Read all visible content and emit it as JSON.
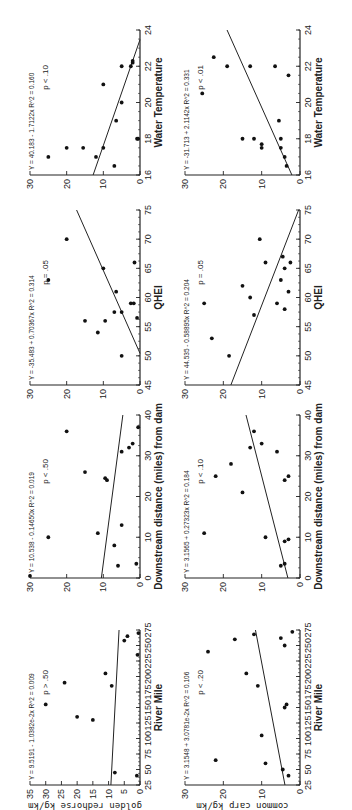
{
  "chart_data": [
    {
      "type": "scatter",
      "row": 0,
      "col": 0,
      "ylabel": "golden redhorse kg/km",
      "xlabel": "River Mile",
      "xlim": [
        25,
        275
      ],
      "ylim": [
        0,
        35
      ],
      "xticks": [
        25,
        50,
        75,
        100,
        125,
        150,
        175,
        200,
        225,
        250,
        275
      ],
      "yticks": [
        0,
        5,
        10,
        15,
        20,
        25,
        30,
        35
      ],
      "equation": "Y = 9.5191 - 1.0382e-2x   R^2 = 0.009",
      "p_value": "p > .50",
      "fit": {
        "intercept": 9.5191,
        "slope": -0.010382
      },
      "points": [
        [
          40,
          1
        ],
        [
          45,
          8
        ],
        [
          130,
          15
        ],
        [
          135,
          20
        ],
        [
          155,
          30
        ],
        [
          185,
          9
        ],
        [
          190,
          24
        ],
        [
          205,
          11
        ],
        [
          235,
          0.8
        ],
        [
          258,
          5
        ],
        [
          265,
          4
        ],
        [
          270,
          0.5
        ]
      ]
    },
    {
      "type": "scatter",
      "row": 0,
      "col": 1,
      "xlabel": "Downstream distance (miles) from dam",
      "xlim": [
        0,
        40
      ],
      "ylim": [
        0,
        30
      ],
      "xticks": [
        0,
        10,
        20,
        30,
        40
      ],
      "yticks": [
        0,
        10,
        20,
        30
      ],
      "equation": "Y = 10.538 - 0.14650x   R^2 = 0.019",
      "p_value": "p < .50",
      "fit": {
        "intercept": 10.538,
        "slope": -0.1465
      },
      "points": [
        [
          0.5,
          30
        ],
        [
          3,
          6
        ],
        [
          3.5,
          1
        ],
        [
          8,
          7
        ],
        [
          10,
          25
        ],
        [
          11,
          11.5
        ],
        [
          13,
          5
        ],
        [
          24,
          9
        ],
        [
          24.5,
          9.5
        ],
        [
          26,
          15
        ],
        [
          31,
          5
        ],
        [
          32,
          3
        ],
        [
          33,
          2
        ],
        [
          36,
          20
        ],
        [
          37,
          0.5
        ]
      ]
    },
    {
      "type": "scatter",
      "row": 0,
      "col": 2,
      "xlabel": "QHEI",
      "xlim": [
        45,
        75
      ],
      "ylim": [
        0,
        30
      ],
      "xticks": [
        45,
        50,
        55,
        60,
        65,
        70,
        75
      ],
      "yticks": [
        0,
        10,
        20,
        30
      ],
      "equation": "Y = -35.483 + 0.70367x   R^2 = 0.314",
      "p_value": "p = .05",
      "fit": {
        "intercept": -35.483,
        "slope": 0.70367
      },
      "points": [
        [
          50,
          5
        ],
        [
          54,
          11.5
        ],
        [
          56,
          15
        ],
        [
          56,
          9.5
        ],
        [
          57.5,
          7
        ],
        [
          57.5,
          5
        ],
        [
          59,
          2.5
        ],
        [
          59,
          1.7
        ],
        [
          56.5,
          0.8
        ],
        [
          61,
          6.5
        ],
        [
          63,
          25
        ],
        [
          65,
          10
        ],
        [
          66,
          1.5
        ],
        [
          70,
          20
        ]
      ]
    },
    {
      "type": "scatter",
      "row": 0,
      "col": 3,
      "xlabel": "Water Temperature",
      "xlim": [
        16,
        24
      ],
      "ylim": [
        0,
        30
      ],
      "xticks": [
        16,
        18,
        20,
        22,
        24
      ],
      "yticks": [
        0,
        10,
        20,
        30
      ],
      "equation": "Y = 40.183 - 1.7122x   R^2 = 0.160",
      "p_value": "p < .10",
      "fit": {
        "intercept": 40.183,
        "slope": -1.7122
      },
      "points": [
        [
          16.5,
          7
        ],
        [
          17,
          25
        ],
        [
          17,
          12
        ],
        [
          17.5,
          20
        ],
        [
          17.5,
          15.5
        ],
        [
          17.5,
          10
        ],
        [
          18,
          0.8
        ],
        [
          18,
          0.5
        ],
        [
          19,
          6.5
        ],
        [
          20,
          5
        ],
        [
          21,
          10
        ],
        [
          22,
          5
        ],
        [
          22,
          2.5
        ],
        [
          22.2,
          2
        ],
        [
          22.3,
          2
        ]
      ]
    },
    {
      "type": "scatter",
      "row": 1,
      "col": 0,
      "ylabel": "common carp kg/km",
      "xlabel": "River Mile",
      "xlim": [
        25,
        275
      ],
      "ylim": [
        0,
        30
      ],
      "xticks": [
        25,
        50,
        75,
        100,
        125,
        150,
        175,
        200,
        225,
        250,
        275
      ],
      "yticks": [
        0,
        10,
        20,
        30
      ],
      "equation": "Y = 3.1548 + 3.0781e-2x   R^2 = 0.106",
      "p_value": "p < .20",
      "fit": {
        "intercept": 3.1548,
        "slope": 0.030781
      },
      "points": [
        [
          40,
          3
        ],
        [
          50,
          4.5
        ],
        [
          60,
          9
        ],
        [
          65,
          22
        ],
        [
          105,
          10
        ],
        [
          150,
          4
        ],
        [
          155,
          3.5
        ],
        [
          185,
          11
        ],
        [
          205,
          14
        ],
        [
          240,
          24
        ],
        [
          250,
          4
        ],
        [
          260,
          17
        ],
        [
          262,
          5
        ],
        [
          268,
          12
        ],
        [
          272,
          2
        ]
      ]
    },
    {
      "type": "scatter",
      "row": 1,
      "col": 1,
      "xlabel": "Downstream distance (miles) from dam",
      "xlim": [
        0,
        40
      ],
      "ylim": [
        0,
        30
      ],
      "xticks": [
        0,
        10,
        20,
        30,
        40
      ],
      "yticks": [
        0,
        10,
        20,
        30
      ],
      "equation": "Y = 3.1565 + 0.27323x   R^2 = 0.184",
      "p_value": "p < .10",
      "fit": {
        "intercept": 3.1565,
        "slope": 0.27323
      },
      "points": [
        [
          3,
          5
        ],
        [
          3.5,
          4
        ],
        [
          9,
          4
        ],
        [
          9.5,
          3
        ],
        [
          10,
          9
        ],
        [
          11,
          25
        ],
        [
          21,
          15
        ],
        [
          24,
          4
        ],
        [
          25,
          3
        ],
        [
          25,
          22
        ],
        [
          28,
          18
        ],
        [
          31,
          6
        ],
        [
          32,
          13
        ],
        [
          33,
          10
        ],
        [
          36,
          12
        ]
      ]
    },
    {
      "type": "scatter",
      "row": 1,
      "col": 2,
      "xlabel": "QHEI",
      "xlim": [
        45,
        75
      ],
      "ylim": [
        0,
        30
      ],
      "xticks": [
        45,
        50,
        55,
        60,
        65,
        70,
        75
      ],
      "yticks": [
        0,
        10,
        20,
        30
      ],
      "equation": "Y = 44.535 - 0.58895x   R^2 = 0.204",
      "p_value": "p = .05",
      "fit": {
        "intercept": 44.535,
        "slope": -0.58895
      },
      "points": [
        [
          50,
          18.5
        ],
        [
          53,
          23
        ],
        [
          57,
          12
        ],
        [
          58,
          4
        ],
        [
          59,
          25
        ],
        [
          59,
          6
        ],
        [
          60,
          13
        ],
        [
          61,
          3
        ],
        [
          62,
          15
        ],
        [
          63,
          5
        ],
        [
          65,
          4
        ],
        [
          66,
          9
        ],
        [
          66,
          2.5
        ],
        [
          67,
          4.5
        ],
        [
          70,
          10.5
        ]
      ]
    },
    {
      "type": "scatter",
      "row": 1,
      "col": 3,
      "xlabel": "Water Temperature",
      "xlim": [
        16,
        24
      ],
      "ylim": [
        0,
        30
      ],
      "xticks": [
        16,
        18,
        20,
        22,
        24
      ],
      "yticks": [
        0,
        10,
        20,
        30
      ],
      "equation": "Y = -31.713 + 2.1142x   R^2 = 0.331",
      "p_value": "p < .01",
      "fit": {
        "intercept": -31.713,
        "slope": 2.1142
      },
      "points": [
        [
          16.5,
          3.5
        ],
        [
          17,
          4
        ],
        [
          17.5,
          5
        ],
        [
          17.5,
          10
        ],
        [
          17.7,
          10
        ],
        [
          18,
          15
        ],
        [
          18,
          12
        ],
        [
          18,
          5
        ],
        [
          19,
          5.5
        ],
        [
          20.5,
          25.5
        ],
        [
          21.5,
          3
        ],
        [
          22,
          19
        ],
        [
          22,
          13
        ],
        [
          22,
          6.5
        ],
        [
          22.5,
          22.5
        ]
      ]
    }
  ]
}
